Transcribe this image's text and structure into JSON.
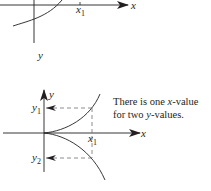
{
  "top_graph": {
    "x_axis_label": "x",
    "y_axis_label": "y",
    "x1_label": "x",
    "x1_sub": "1"
  },
  "bottom_graph": {
    "x_axis_label": "x",
    "y_axis_label": "y",
    "x1_label": "x",
    "x1_sub": "1",
    "y1_label": "y",
    "y1_sub": "1",
    "y2_label": "y",
    "y2_sub": "2"
  },
  "caption": {
    "line1_pre": "There is one ",
    "line1_var": "x",
    "line1_post": "-value",
    "line2_pre": "for two ",
    "line2_var": "y",
    "line2_post": "-values."
  },
  "colors": {
    "ink": "#231f20",
    "dashed": "#6d6e71"
  }
}
